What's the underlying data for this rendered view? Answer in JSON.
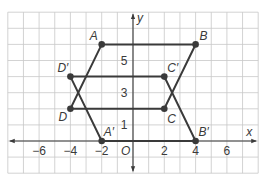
{
  "diagram": {
    "type": "coordinate-plane",
    "axes": {
      "x_label": "x",
      "y_label": "y",
      "origin_label": "O",
      "x_range": [
        -8,
        8
      ],
      "y_range": [
        -2,
        8
      ],
      "x_ticks": [
        {
          "value": -6,
          "label": "−6"
        },
        {
          "value": -4,
          "label": "−4"
        },
        {
          "value": -2,
          "label": "−2"
        },
        {
          "value": 2,
          "label": "2"
        },
        {
          "value": 4,
          "label": "4"
        },
        {
          "value": 6,
          "label": "6"
        }
      ],
      "y_ticks": [
        {
          "value": 1,
          "label": "1"
        },
        {
          "value": 3,
          "label": "3"
        },
        {
          "value": 5,
          "label": "5"
        }
      ]
    },
    "points": [
      {
        "name": "A",
        "label": "A",
        "x": -2,
        "y": 6
      },
      {
        "name": "B",
        "label": "B",
        "x": 4,
        "y": 6
      },
      {
        "name": "C",
        "label": "C",
        "x": 2,
        "y": 2
      },
      {
        "name": "D",
        "label": "D",
        "x": -4,
        "y": 2
      },
      {
        "name": "A-prime",
        "label": "A′",
        "x": -2,
        "y": 0
      },
      {
        "name": "B-prime",
        "label": "B′",
        "x": 4,
        "y": 0
      },
      {
        "name": "C-prime",
        "label": "C′",
        "x": 2,
        "y": 4
      },
      {
        "name": "D-prime",
        "label": "D′",
        "x": -4,
        "y": 4
      }
    ],
    "polygons": [
      {
        "name": "ABCD",
        "vertices": [
          "A",
          "B",
          "C",
          "D"
        ]
      },
      {
        "name": "A'B'C'D'",
        "vertices": [
          "A-prime",
          "B-prime",
          "C-prime",
          "D-prime"
        ]
      }
    ],
    "colors": {
      "grid": "#c8c8c8",
      "axis": "#3a3a3a",
      "shape": "#3a3a3a",
      "text": "#3a3a3a"
    }
  }
}
